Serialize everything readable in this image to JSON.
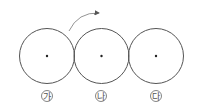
{
  "diagram": {
    "type": "three tangent circles (gears/wheels) with rotation arrow",
    "circles": [
      {
        "label": "가",
        "cx": 47,
        "cy": 56,
        "r": 27
      },
      {
        "label": "나",
        "cx": 101,
        "cy": 56,
        "r": 27
      },
      {
        "label": "다",
        "cx": 156,
        "cy": 56,
        "r": 27
      }
    ],
    "arrow": {
      "description": "clockwise rotation arrow above circle 가",
      "from": [
        69,
        31
      ],
      "to": [
        100,
        13
      ]
    },
    "colors": {
      "stroke": "#555555",
      "arrow": "#777777",
      "center_dot": "#222222"
    }
  }
}
